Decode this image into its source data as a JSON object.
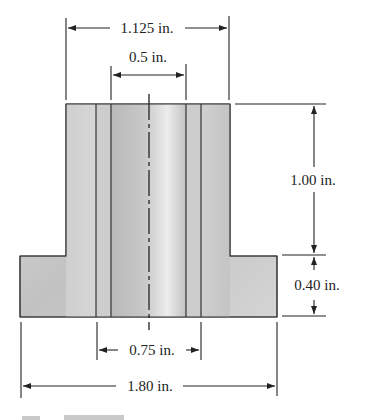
{
  "figure": {
    "type": "engineering cross-section drawing",
    "colors": {
      "fill_light": "#e2e2e2",
      "fill_mid": "#c6c6c6",
      "fill_dark": "#b4b4b4",
      "line": "#222222"
    }
  },
  "dimensions": {
    "top_width": "1.125 in.",
    "bore_width": "0.5 in.",
    "upper_height": "1.00 in.",
    "flange_height": "0.40 in.",
    "inner_width": "0.75 in.",
    "flange_width": "1.80 in."
  },
  "caption": {
    "text": ""
  }
}
